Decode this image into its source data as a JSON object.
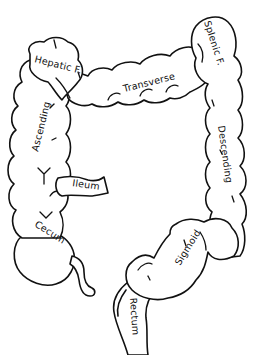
{
  "diagram": {
    "style": "black line drawing on white background",
    "colors": {
      "line": "#111111",
      "background": "#ffffff"
    },
    "labels": {
      "hepatic": "Hepatic F.",
      "splenic": "Splenic F.",
      "transverse": "Transverse",
      "ascending": "Ascending",
      "descending": "Descending",
      "ileum": "Ileum",
      "cecum": "Cecum",
      "sigmoid": "Sigmoid",
      "rectum": "Rectum"
    },
    "nodes": [
      {
        "id": "hepatic",
        "label": "Hepatic F.",
        "position": "upper-left"
      },
      {
        "id": "transverse",
        "label": "Transverse",
        "position": "top-center"
      },
      {
        "id": "splenic",
        "label": "Splenic F.",
        "position": "upper-right"
      },
      {
        "id": "ascending",
        "label": "Ascending",
        "position": "left"
      },
      {
        "id": "descending",
        "label": "Descending",
        "position": "right"
      },
      {
        "id": "ileum",
        "label": "Ileum",
        "position": "lower-left-center"
      },
      {
        "id": "cecum",
        "label": "Cecum",
        "position": "lower-left"
      },
      {
        "id": "sigmoid",
        "label": "Sigmoid",
        "position": "lower-right"
      },
      {
        "id": "rectum",
        "label": "Rectum",
        "position": "bottom-center"
      }
    ],
    "edges": [
      {
        "from": "ileum",
        "to": "cecum"
      },
      {
        "from": "cecum",
        "to": "ascending"
      },
      {
        "from": "ascending",
        "to": "hepatic"
      },
      {
        "from": "hepatic",
        "to": "transverse"
      },
      {
        "from": "transverse",
        "to": "splenic"
      },
      {
        "from": "splenic",
        "to": "descending"
      },
      {
        "from": "descending",
        "to": "sigmoid"
      },
      {
        "from": "sigmoid",
        "to": "rectum"
      }
    ]
  }
}
